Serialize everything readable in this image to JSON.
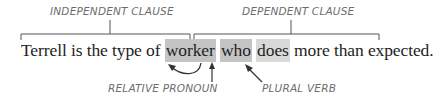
{
  "labels": {
    "independent_clause": "INDEPENDENT CLAUSE",
    "dependent_clause": "DEPENDENT CLAUSE",
    "relative_pronoun": "RELATIVE PRONOUN",
    "plural_verb": "PLURAL VERB"
  },
  "sentence": {
    "part1": "Terrell is the type of ",
    "antecedent": "worker",
    "space1": " ",
    "pronoun": "who",
    "space2": " ",
    "verb": "does",
    "part2": " more than expected."
  },
  "colors": {
    "text": "#1e1e1e",
    "label": "#6d6d6d",
    "highlight_dark": "#c4c4c4",
    "highlight_light": "#d9d9d9",
    "line": "#555555"
  }
}
